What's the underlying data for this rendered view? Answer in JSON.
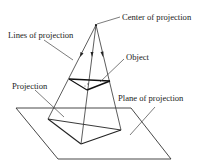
{
  "diagram": {
    "type": "perspective-projection",
    "labels": {
      "center": "Center of projection",
      "lines": "Lines of projection",
      "object": "Object",
      "projection": "Projection",
      "plane": "Plane of projection"
    },
    "colors": {
      "line": "#222222",
      "background": "#ffffff"
    }
  }
}
